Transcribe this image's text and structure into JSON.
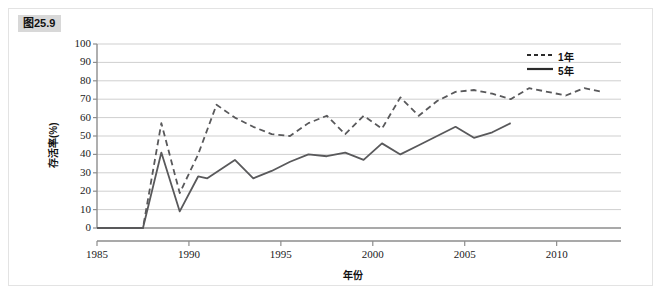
{
  "figure": {
    "tag": "图25.9"
  },
  "chart_data": {
    "type": "line",
    "title": "",
    "xlabel": "年份",
    "ylabel": "存活率(%)",
    "xlim": [
      1985,
      2013.5
    ],
    "ylim": [
      0,
      100
    ],
    "grid": true,
    "legend_position": "top-right",
    "x_ticks": [
      1985,
      1990,
      1995,
      2000,
      2005,
      2010
    ],
    "x_tick_labels": [
      "1985",
      "1990",
      "1995",
      "2000",
      "2005",
      "2010"
    ],
    "y_ticks": [
      0,
      10,
      20,
      30,
      40,
      50,
      60,
      70,
      80,
      90,
      100
    ],
    "y_tick_labels": [
      "0",
      "10",
      "20",
      "30",
      "40",
      "50",
      "60",
      "70",
      "80",
      "90",
      "100"
    ],
    "series": [
      {
        "name": "1年",
        "style": "dashed",
        "color": "#59595b",
        "x": [
          1985,
          1986,
          1987,
          1987.5,
          1988.5,
          1989.5,
          1990.5,
          1991.5,
          1992.5,
          1993.5,
          1994.5,
          1995.5,
          1996.5,
          1997.5,
          1998.5,
          1999.5,
          2000.5,
          2001.5,
          2002.5,
          2003.5,
          2004.5,
          2005.5,
          2006.5,
          2007.5,
          2008.5,
          2009.5,
          2010.5,
          2011.5,
          2012.5
        ],
        "values": [
          0,
          0,
          0,
          0,
          57,
          19,
          40,
          67,
          60,
          55,
          51,
          50,
          57,
          61,
          51,
          61,
          54,
          71,
          61,
          69,
          74,
          75,
          73,
          70,
          76,
          74,
          72,
          76,
          74
        ]
      },
      {
        "name": "5年",
        "style": "solid",
        "color": "#59595b",
        "x": [
          1985,
          1986,
          1987,
          1987.5,
          1988.5,
          1989.5,
          1990.5,
          1991,
          1992.5,
          1993.5,
          1994.5,
          1995.5,
          1996.5,
          1997.5,
          1998.5,
          1999.5,
          2000.5,
          2001.5,
          2002.5,
          2003.5,
          2004.5,
          2005.5,
          2006.5,
          2007.5
        ],
        "values": [
          0,
          0,
          0,
          0,
          41,
          9,
          28,
          27,
          37,
          27,
          31,
          36,
          40,
          39,
          41,
          37,
          46,
          40,
          45,
          50,
          55,
          49,
          52,
          57
        ]
      }
    ],
    "legend": [
      {
        "label": "1年",
        "style": "dashed"
      },
      {
        "label": "5年",
        "style": "solid"
      }
    ]
  }
}
